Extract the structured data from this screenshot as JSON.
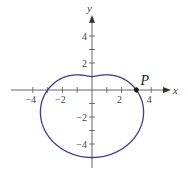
{
  "chart_data": {
    "type": "line",
    "title": "",
    "curve": {
      "kind": "polar",
      "equation": "r = 3 - 2 sin(theta)",
      "a": 3,
      "b": -2,
      "color": "#3a3f8a",
      "key_points": [
        {
          "x": 3,
          "y": 0
        },
        {
          "x": 0,
          "y": 1
        },
        {
          "x": -3,
          "y": 0
        },
        {
          "x": 0,
          "y": -5
        }
      ]
    },
    "xlabel": "x",
    "ylabel": "y",
    "x_ticks": [
      -4,
      -3,
      -2,
      -1,
      1,
      2,
      3,
      4
    ],
    "y_ticks": [
      -5,
      -4,
      -3,
      -2,
      -1,
      1,
      2,
      3,
      4,
      5
    ],
    "x_tick_labels": [
      {
        "value": -4,
        "label": "−4"
      },
      {
        "value": -2,
        "label": "−2"
      },
      {
        "value": 2,
        "label": "2"
      },
      {
        "value": 4,
        "label": "4"
      }
    ],
    "y_tick_labels": [
      {
        "value": 4,
        "label": "4"
      },
      {
        "value": 2,
        "label": "2"
      },
      {
        "value": -2,
        "label": "−2"
      },
      {
        "value": -4,
        "label": "−4"
      }
    ],
    "annotations": [
      {
        "label": "P",
        "x": 3,
        "y": 0
      }
    ],
    "xlim": [
      -5.5,
      5.3
    ],
    "ylim": [
      -5.8,
      5.5
    ],
    "grid": false
  }
}
